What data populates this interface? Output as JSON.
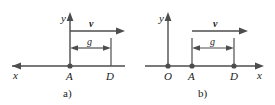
{
  "figure": {
    "caption_a": "a)",
    "caption_b": "b)",
    "stroke_color": "#4d4d4d",
    "text_color": "#1a1a1a",
    "background_color": "#ffffff"
  },
  "panel_a": {
    "label": "a)",
    "y_axis_label": "y",
    "x_axis_label": "x",
    "x_axis_direction": "left",
    "y_axis_direction": "up",
    "velocity_label": "v",
    "velocity_direction": "right",
    "distance_label": "g",
    "points": [
      {
        "name": "A",
        "label": "A",
        "marked": true
      },
      {
        "name": "D",
        "label": "D",
        "marked": false
      }
    ]
  },
  "panel_b": {
    "label": "b)",
    "y_axis_label": "y",
    "x_axis_label": "x",
    "x_axis_direction": "right",
    "y_axis_direction": "up",
    "velocity_label": "v",
    "velocity_direction": "right",
    "distance_label": "g",
    "points": [
      {
        "name": "O",
        "label": "O",
        "marked": true
      },
      {
        "name": "A",
        "label": "A",
        "marked": true
      },
      {
        "name": "D",
        "label": "D",
        "marked": true
      }
    ]
  }
}
